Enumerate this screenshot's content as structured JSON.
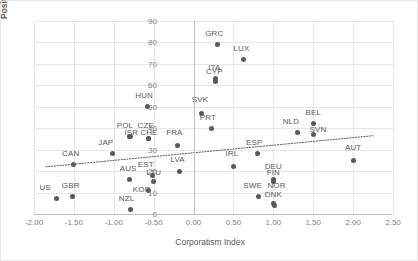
{
  "chart_data": {
    "type": "scatter",
    "title": "",
    "xlabel": "Corporatism Index",
    "ylabel": "Position in Ease of Doing Business Ranking",
    "xlim": [
      -2.0,
      2.5
    ],
    "ylim": [
      0,
      90
    ],
    "xticks": [
      "-2.00",
      "-1.50",
      "-1.00",
      "-0.50",
      "0.00",
      "0.50",
      "1.00",
      "1.50",
      "2.00",
      "2.50"
    ],
    "xtick_values": [
      -2.0,
      -1.5,
      -1.0,
      -0.5,
      0.0,
      0.5,
      1.0,
      1.5,
      2.0,
      2.5
    ],
    "yticks": [
      "0",
      "10",
      "20",
      "30",
      "40",
      "50",
      "60",
      "70",
      "80",
      "90"
    ],
    "ytick_values": [
      0,
      10,
      20,
      30,
      40,
      50,
      60,
      70,
      80,
      90
    ],
    "grid": true,
    "legend": false,
    "point_color": "#595959",
    "grid_color": "#e6e6e6",
    "trendline": {
      "style": "dotted",
      "color": "#595959",
      "x0": -1.85,
      "y0": 22.0,
      "x1": 2.25,
      "y1": 36.5
    },
    "points": [
      {
        "label": "US",
        "x": -1.72,
        "y": 7,
        "lx": -1.86,
        "ly": 12
      },
      {
        "label": "GBR",
        "x": -1.52,
        "y": 8,
        "lx": -1.54,
        "ly": 13
      },
      {
        "label": "CAN",
        "x": -1.5,
        "y": 23,
        "lx": -1.54,
        "ly": 28
      },
      {
        "label": "JAP",
        "x": -1.02,
        "y": 28,
        "lx": -1.1,
        "ly": 33
      },
      {
        "label": "AUS",
        "x": -0.8,
        "y": 16,
        "lx": -0.82,
        "ly": 21
      },
      {
        "label": "NZL",
        "x": -0.79,
        "y": 2,
        "lx": -0.84,
        "ly": 7
      },
      {
        "label": "POL",
        "x": -0.8,
        "y": 36,
        "lx": -0.86,
        "ly": 41
      },
      {
        "label": "ISR",
        "x": -0.79,
        "y": 36,
        "lx": -0.78,
        "ly": 38
      },
      {
        "label": "CZE",
        "x": -0.57,
        "y": 35,
        "lx": -0.6,
        "ly": 41
      },
      {
        "label": "CHE",
        "x": -0.56,
        "y": 35,
        "lx": -0.56,
        "ly": 38
      },
      {
        "label": "HUN",
        "x": -0.58,
        "y": 50,
        "lx": -0.62,
        "ly": 55
      },
      {
        "label": "KOR",
        "x": -0.57,
        "y": 11,
        "lx": -0.65,
        "ly": 11
      },
      {
        "label": "EST",
        "x": -0.52,
        "y": 18,
        "lx": -0.6,
        "ly": 23
      },
      {
        "label": "LTU",
        "x": -0.5,
        "y": 15,
        "lx": -0.5,
        "ly": 19
      },
      {
        "label": "FRA",
        "x": -0.2,
        "y": 32,
        "lx": -0.24,
        "ly": 38
      },
      {
        "label": "LVA",
        "x": -0.18,
        "y": 20,
        "lx": -0.2,
        "ly": 25
      },
      {
        "label": "SVK",
        "x": 0.1,
        "y": 47,
        "lx": 0.08,
        "ly": 53
      },
      {
        "label": "PRT",
        "x": 0.22,
        "y": 40,
        "lx": 0.18,
        "ly": 45
      },
      {
        "label": "ITA",
        "x": 0.28,
        "y": 62,
        "lx": 0.26,
        "ly": 68
      },
      {
        "label": "CYP",
        "x": 0.28,
        "y": 63,
        "lx": 0.26,
        "ly": 66
      },
      {
        "label": "GRC",
        "x": 0.3,
        "y": 79,
        "lx": 0.26,
        "ly": 84
      },
      {
        "label": "IRL",
        "x": 0.5,
        "y": 22,
        "lx": 0.48,
        "ly": 28
      },
      {
        "label": "LUX",
        "x": 0.62,
        "y": 72,
        "lx": 0.6,
        "ly": 77
      },
      {
        "label": "ESP",
        "x": 0.8,
        "y": 28,
        "lx": 0.76,
        "ly": 33
      },
      {
        "label": "SWE",
        "x": 0.82,
        "y": 8,
        "lx": 0.74,
        "ly": 13
      },
      {
        "label": "DEU",
        "x": 1.0,
        "y": 16,
        "lx": 1.0,
        "ly": 22
      },
      {
        "label": "FIN",
        "x": 1.0,
        "y": 15,
        "lx": 1.0,
        "ly": 19
      },
      {
        "label": "NOR",
        "x": 1.0,
        "y": 5,
        "lx": 1.04,
        "ly": 13
      },
      {
        "label": "DNK",
        "x": 1.01,
        "y": 4,
        "lx": 1.0,
        "ly": 9
      },
      {
        "label": "NLD",
        "x": 1.3,
        "y": 38,
        "lx": 1.22,
        "ly": 43
      },
      {
        "label": "SVN",
        "x": 1.5,
        "y": 37,
        "lx": 1.56,
        "ly": 39
      },
      {
        "label": "BEL",
        "x": 1.5,
        "y": 42,
        "lx": 1.5,
        "ly": 47
      },
      {
        "label": "AUT",
        "x": 2.0,
        "y": 25,
        "lx": 2.0,
        "ly": 31
      }
    ]
  }
}
